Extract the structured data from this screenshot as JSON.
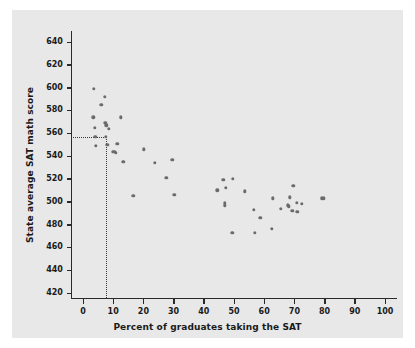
{
  "chart_data": {
    "type": "scatter",
    "title": "",
    "xlabel": "Percent of graduates taking the SAT",
    "ylabel": "State average SAT math score",
    "xlim": [
      -4,
      104
    ],
    "ylim": [
      416,
      650
    ],
    "xticks": [
      0,
      10,
      20,
      30,
      40,
      50,
      60,
      70,
      80,
      90,
      100
    ],
    "yticks": [
      420,
      440,
      460,
      480,
      500,
      520,
      540,
      560,
      580,
      600,
      620,
      640
    ],
    "grid": false,
    "legend": null,
    "marker_color": "#6b6b6b",
    "panel_color": "#e8e8e8",
    "annotations": {
      "reference_lines": {
        "style": "dotted",
        "x_value": 7.5,
        "y_value": 557,
        "description": "dotted guide lines from y-axis at 557 down to x-axis at 7.5"
      }
    },
    "points": [
      {
        "x": 3.6,
        "y": 599
      },
      {
        "x": 3.4,
        "y": 574
      },
      {
        "x": 3.9,
        "y": 565
      },
      {
        "x": 4.3,
        "y": 549
      },
      {
        "x": 4.1,
        "y": 557
      },
      {
        "x": 6.0,
        "y": 585
      },
      {
        "x": 7.2,
        "y": 592
      },
      {
        "x": 7.4,
        "y": 569
      },
      {
        "x": 7.7,
        "y": 567
      },
      {
        "x": 7.5,
        "y": 557
      },
      {
        "x": 8.0,
        "y": 550
      },
      {
        "x": 8.6,
        "y": 564
      },
      {
        "x": 9.8,
        "y": 544
      },
      {
        "x": 10.4,
        "y": 544
      },
      {
        "x": 10.8,
        "y": 543
      },
      {
        "x": 11.3,
        "y": 551
      },
      {
        "x": 12.6,
        "y": 574
      },
      {
        "x": 13.4,
        "y": 535
      },
      {
        "x": 16.6,
        "y": 505
      },
      {
        "x": 20.1,
        "y": 546
      },
      {
        "x": 23.8,
        "y": 534
      },
      {
        "x": 27.6,
        "y": 521
      },
      {
        "x": 29.6,
        "y": 537
      },
      {
        "x": 30.2,
        "y": 506
      },
      {
        "x": 44.5,
        "y": 510
      },
      {
        "x": 46.5,
        "y": 519
      },
      {
        "x": 47.3,
        "y": 512
      },
      {
        "x": 46.9,
        "y": 499
      },
      {
        "x": 47.0,
        "y": 497
      },
      {
        "x": 49.6,
        "y": 520
      },
      {
        "x": 49.5,
        "y": 473
      },
      {
        "x": 53.5,
        "y": 509
      },
      {
        "x": 56.6,
        "y": 493
      },
      {
        "x": 56.9,
        "y": 473
      },
      {
        "x": 58.7,
        "y": 486
      },
      {
        "x": 62.8,
        "y": 503
      },
      {
        "x": 62.6,
        "y": 476
      },
      {
        "x": 65.5,
        "y": 494
      },
      {
        "x": 67.8,
        "y": 497
      },
      {
        "x": 68.2,
        "y": 496
      },
      {
        "x": 68.4,
        "y": 504
      },
      {
        "x": 69.6,
        "y": 514
      },
      {
        "x": 69.3,
        "y": 492
      },
      {
        "x": 70.8,
        "y": 499
      },
      {
        "x": 71.0,
        "y": 491
      },
      {
        "x": 72.4,
        "y": 498
      },
      {
        "x": 79.0,
        "y": 503
      },
      {
        "x": 79.8,
        "y": 503
      }
    ]
  }
}
